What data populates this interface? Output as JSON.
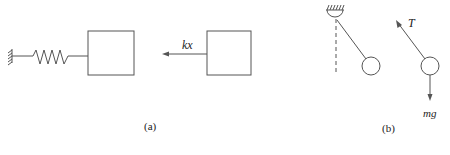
{
  "panels": [
    {
      "id": "a",
      "caption": "(a)",
      "description": "Block attached to a spring fixed to a wall; free-body diagram shows force kx pointing left",
      "force_labels": [
        "kx"
      ]
    },
    {
      "id": "b",
      "caption": "(b)",
      "description": "Pendulum hanging from a ceiling support displaced from vertical; free-body diagram of bob shows tension T and weight mg",
      "force_labels": [
        "T",
        "mg"
      ]
    }
  ],
  "labels": {
    "spring_force": "kx",
    "tension": "T",
    "weight": "mg",
    "caption_a": "(a)",
    "caption_b": "(b)"
  },
  "colors": {
    "stroke": "#555555",
    "text": "#222222",
    "background": "#ffffff"
  }
}
